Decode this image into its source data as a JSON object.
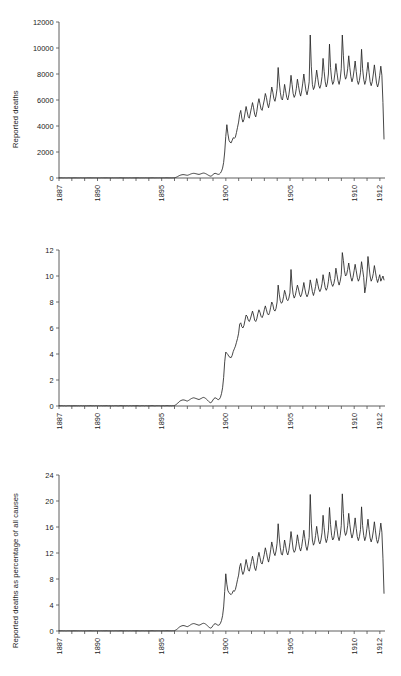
{
  "figure": {
    "title": "",
    "panel_count": 3,
    "background": "#ffffff",
    "line_color": "#262626",
    "axis_color": "#4d4d4d"
  },
  "chart_data": [
    {
      "type": "line",
      "panel_index": 0,
      "title": "",
      "xlabel": "",
      "ylabel": "Reported deaths",
      "xlim": [
        1887,
        1912.4
      ],
      "ylim": [
        0,
        12000
      ],
      "yticks": [
        0,
        2000,
        4000,
        6000,
        8000,
        10000,
        12000
      ],
      "ytick_labels": [
        "0",
        "2000",
        "4000",
        "6000",
        "8000",
        "10000",
        "12000"
      ],
      "xticks": [
        1887,
        1888,
        1889,
        1890,
        1891,
        1892,
        1893,
        1894,
        1895,
        1896,
        1897,
        1898,
        1899,
        1900,
        1901,
        1902,
        1903,
        1904,
        1905,
        1906,
        1907,
        1908,
        1909,
        1910,
        1911,
        1912
      ],
      "xtick_labels_shown": [
        "1887",
        "1890",
        "1895",
        "1900",
        "1905",
        "1910",
        "1912"
      ],
      "xtick_labels_shown_at": [
        1887,
        1890,
        1895,
        1900,
        1905,
        1910,
        1912
      ],
      "grid": false,
      "legend": "none",
      "x_step": 0.0833,
      "x_start": 1887.0,
      "values": [
        10,
        8,
        12,
        9,
        7,
        11,
        8,
        6,
        9,
        12,
        10,
        8,
        9,
        7,
        11,
        8,
        10,
        6,
        9,
        7,
        12,
        10,
        8,
        11,
        7,
        9,
        8,
        12,
        6,
        10,
        9,
        7,
        11,
        8,
        10,
        9,
        8,
        11,
        7,
        9,
        12,
        8,
        10,
        6,
        9,
        11,
        8,
        10,
        9,
        7,
        12,
        8,
        10,
        9,
        11,
        7,
        8,
        12,
        10,
        9,
        8,
        10,
        7,
        11,
        9,
        8,
        12,
        10,
        7,
        9,
        11,
        8,
        10,
        9,
        12,
        8,
        7,
        11,
        9,
        10,
        8,
        12,
        9,
        7,
        11,
        8,
        10,
        9,
        12,
        7,
        8,
        11,
        10,
        9,
        12,
        8,
        10,
        9,
        11,
        8,
        12,
        10,
        9,
        7,
        11,
        8,
        10,
        12,
        20,
        40,
        70,
        110,
        160,
        200,
        230,
        250,
        260,
        255,
        240,
        220,
        210,
        230,
        260,
        300,
        330,
        350,
        360,
        350,
        330,
        310,
        290,
        280,
        300,
        330,
        360,
        380,
        370,
        340,
        300,
        250,
        200,
        160,
        140,
        180,
        260,
        330,
        360,
        340,
        300,
        280,
        300,
        380,
        520,
        760,
        1200,
        2000,
        3200,
        4100,
        3400,
        2900,
        2750,
        2700,
        2900,
        3100,
        3050,
        3150,
        3500,
        3900,
        4300,
        4900,
        5200,
        4600,
        4300,
        4500,
        5000,
        5500,
        5100,
        4700,
        4600,
        5000,
        5400,
        5800,
        5400,
        4900,
        4700,
        5100,
        5700,
        6100,
        5700,
        5300,
        5200,
        5600,
        6000,
        6500,
        6200,
        5700,
        5400,
        5800,
        6400,
        7000,
        6600,
        6100,
        5900,
        6300,
        6900,
        8500,
        7400,
        6600,
        6100,
        6000,
        6500,
        7200,
        6700,
        6200,
        6000,
        6400,
        7000,
        7900,
        7200,
        6500,
        6200,
        6400,
        6900,
        7600,
        7100,
        6600,
        6300,
        6700,
        7300,
        8000,
        7300,
        6700,
        6400,
        6800,
        7400,
        11000,
        8600,
        7200,
        6800,
        7000,
        7600,
        8300,
        7700,
        7100,
        6900,
        7200,
        7800,
        9200,
        8200,
        7400,
        7000,
        7300,
        8000,
        10300,
        8500,
        7600,
        7200,
        7400,
        8000,
        8800,
        8100,
        7500,
        7200,
        7600,
        8400,
        11000,
        9400,
        8000,
        7600,
        7800,
        8400,
        9400,
        8500,
        7800,
        7400,
        7700,
        8300,
        9000,
        8200,
        7500,
        7200,
        7500,
        8100,
        9900,
        8400,
        7600,
        7200,
        7500,
        8200,
        8900,
        8100,
        7400,
        7100,
        7400,
        8000,
        8700,
        8000,
        7300,
        7000,
        7300,
        7900,
        8600,
        7900,
        5800,
        3000,
        500
      ]
    },
    {
      "type": "line",
      "panel_index": 1,
      "title": "",
      "xlabel": "",
      "ylabel": "Reported deaths as percentage of all causes",
      "xlim": [
        1887,
        1912.4
      ],
      "ylim": [
        0,
        12
      ],
      "yticks": [
        0,
        2,
        4,
        6,
        8,
        10,
        12
      ],
      "ytick_labels": [
        "0",
        "2",
        "4",
        "6",
        "8",
        "10",
        "12"
      ],
      "xticks": [
        1887,
        1888,
        1889,
        1890,
        1891,
        1892,
        1893,
        1894,
        1895,
        1896,
        1897,
        1898,
        1899,
        1900,
        1901,
        1902,
        1903,
        1904,
        1905,
        1906,
        1907,
        1908,
        1909,
        1910,
        1911,
        1912
      ],
      "xtick_labels_shown": [
        "1887",
        "1890",
        "1895",
        "1900",
        "1905",
        "1910",
        "1912"
      ],
      "xtick_labels_shown_at": [
        1887,
        1890,
        1895,
        1900,
        1905,
        1910,
        1912
      ],
      "grid": false,
      "legend": "none",
      "x_step": 0.0833,
      "x_start": 1887.0,
      "values": [
        0.02,
        0.01,
        0.02,
        0.02,
        0.01,
        0.02,
        0.01,
        0.01,
        0.02,
        0.02,
        0.02,
        0.01,
        0.02,
        0.01,
        0.02,
        0.01,
        0.02,
        0.01,
        0.02,
        0.01,
        0.02,
        0.02,
        0.01,
        0.02,
        0.01,
        0.02,
        0.01,
        0.02,
        0.01,
        0.02,
        0.02,
        0.01,
        0.02,
        0.01,
        0.02,
        0.02,
        0.01,
        0.02,
        0.01,
        0.02,
        0.02,
        0.01,
        0.02,
        0.01,
        0.02,
        0.02,
        0.01,
        0.02,
        0.02,
        0.01,
        0.02,
        0.01,
        0.02,
        0.02,
        0.02,
        0.01,
        0.01,
        0.02,
        0.02,
        0.02,
        0.01,
        0.02,
        0.01,
        0.02,
        0.02,
        0.01,
        0.02,
        0.02,
        0.01,
        0.02,
        0.02,
        0.01,
        0.02,
        0.02,
        0.02,
        0.01,
        0.01,
        0.02,
        0.02,
        0.02,
        0.01,
        0.02,
        0.02,
        0.01,
        0.02,
        0.01,
        0.02,
        0.02,
        0.02,
        0.01,
        0.01,
        0.02,
        0.02,
        0.02,
        0.02,
        0.01,
        0.02,
        0.02,
        0.02,
        0.01,
        0.02,
        0.02,
        0.02,
        0.01,
        0.02,
        0.01,
        0.02,
        0.02,
        0.04,
        0.08,
        0.14,
        0.21,
        0.3,
        0.37,
        0.42,
        0.45,
        0.47,
        0.46,
        0.44,
        0.4,
        0.38,
        0.42,
        0.47,
        0.53,
        0.58,
        0.61,
        0.63,
        0.61,
        0.58,
        0.55,
        0.52,
        0.5,
        0.54,
        0.58,
        0.63,
        0.66,
        0.64,
        0.59,
        0.52,
        0.44,
        0.35,
        0.28,
        0.25,
        0.32,
        0.46,
        0.58,
        0.63,
        0.6,
        0.53,
        0.49,
        0.53,
        0.67,
        0.95,
        1.4,
        2.2,
        3.4,
        4.15,
        4.05,
        3.95,
        3.8,
        3.75,
        3.72,
        3.9,
        4.2,
        4.4,
        4.6,
        4.9,
        5.2,
        5.6,
        6.3,
        6.4,
        6.1,
        6.0,
        6.2,
        6.6,
        7.0,
        6.9,
        6.6,
        6.5,
        6.7,
        7.0,
        7.3,
        7.0,
        6.6,
        6.5,
        6.7,
        7.1,
        7.4,
        7.2,
        6.9,
        6.8,
        7.0,
        7.4,
        7.7,
        7.4,
        7.1,
        7.0,
        7.2,
        7.6,
        8.0,
        7.8,
        7.4,
        7.3,
        7.5,
        8.0,
        9.3,
        8.6,
        8.1,
        7.9,
        8.0,
        8.4,
        8.9,
        8.6,
        8.2,
        8.1,
        8.3,
        8.7,
        10.5,
        9.3,
        8.6,
        8.3,
        8.5,
        8.9,
        9.3,
        9.0,
        8.6,
        8.4,
        8.6,
        9.0,
        9.5,
        9.0,
        8.6,
        8.4,
        8.6,
        9.0,
        9.7,
        9.3,
        8.8,
        8.5,
        8.8,
        9.2,
        9.8,
        9.4,
        9.0,
        8.8,
        9.0,
        9.4,
        10.1,
        9.6,
        9.1,
        8.9,
        9.1,
        9.6,
        10.3,
        9.8,
        9.4,
        9.2,
        9.4,
        9.8,
        10.6,
        10.1,
        9.6,
        9.3,
        9.6,
        10.1,
        11.8,
        11.2,
        10.4,
        10.0,
        10.1,
        10.5,
        11.0,
        10.4,
        9.9,
        9.6,
        9.9,
        10.4,
        10.9,
        10.4,
        9.9,
        9.6,
        9.8,
        10.3,
        11.1,
        10.5,
        9.9,
        8.7,
        9.2,
        10.0,
        11.5,
        10.7,
        10.0,
        9.6,
        9.8,
        10.2,
        10.8,
        10.3,
        9.8,
        9.5,
        9.8,
        10.1,
        9.6,
        9.8,
        10.0,
        9.7,
        10.1
      ]
    },
    {
      "type": "line",
      "panel_index": 2,
      "title": "",
      "xlabel": "",
      "ylabel": "Reported deaths per 100,000 population",
      "xlim": [
        1887,
        1912.4
      ],
      "ylim": [
        0,
        24
      ],
      "yticks": [
        0,
        4,
        8,
        12,
        16,
        20,
        24
      ],
      "ytick_labels": [
        "0",
        "4",
        "8",
        "12",
        "16",
        "20",
        "24"
      ],
      "xticks": [
        1887,
        1888,
        1889,
        1890,
        1891,
        1892,
        1893,
        1894,
        1895,
        1896,
        1897,
        1898,
        1899,
        1900,
        1901,
        1902,
        1903,
        1904,
        1905,
        1906,
        1907,
        1908,
        1909,
        1910,
        1911,
        1912
      ],
      "xtick_labels_shown": [
        "1887",
        "1890",
        "1895",
        "1900",
        "1905",
        "1910",
        "1912"
      ],
      "xtick_labels_shown_at": [
        1887,
        1890,
        1895,
        1900,
        1905,
        1910,
        1912
      ],
      "grid": false,
      "legend": "none",
      "x_step": 0.0833,
      "x_start": 1887.0,
      "values": [
        0.03,
        0.02,
        0.03,
        0.03,
        0.02,
        0.03,
        0.02,
        0.02,
        0.03,
        0.03,
        0.03,
        0.02,
        0.03,
        0.02,
        0.03,
        0.02,
        0.03,
        0.02,
        0.03,
        0.02,
        0.03,
        0.03,
        0.02,
        0.03,
        0.02,
        0.03,
        0.02,
        0.03,
        0.02,
        0.03,
        0.03,
        0.02,
        0.03,
        0.02,
        0.03,
        0.03,
        0.02,
        0.03,
        0.02,
        0.03,
        0.03,
        0.02,
        0.03,
        0.02,
        0.03,
        0.03,
        0.02,
        0.03,
        0.03,
        0.02,
        0.03,
        0.02,
        0.03,
        0.03,
        0.03,
        0.02,
        0.02,
        0.03,
        0.03,
        0.03,
        0.02,
        0.03,
        0.02,
        0.03,
        0.03,
        0.02,
        0.03,
        0.03,
        0.02,
        0.03,
        0.03,
        0.02,
        0.03,
        0.03,
        0.03,
        0.02,
        0.02,
        0.03,
        0.03,
        0.03,
        0.02,
        0.03,
        0.03,
        0.02,
        0.03,
        0.02,
        0.03,
        0.03,
        0.03,
        0.02,
        0.02,
        0.03,
        0.03,
        0.03,
        0.03,
        0.02,
        0.03,
        0.03,
        0.03,
        0.02,
        0.03,
        0.03,
        0.03,
        0.02,
        0.03,
        0.02,
        0.03,
        0.03,
        0.06,
        0.13,
        0.23,
        0.36,
        0.52,
        0.65,
        0.74,
        0.8,
        0.84,
        0.82,
        0.78,
        0.71,
        0.67,
        0.74,
        0.83,
        0.95,
        1.05,
        1.11,
        1.14,
        1.11,
        1.05,
        0.99,
        0.93,
        0.89,
        0.95,
        1.04,
        1.13,
        1.19,
        1.16,
        1.07,
        0.94,
        0.79,
        0.63,
        0.5,
        0.44,
        0.57,
        0.82,
        1.04,
        1.13,
        1.07,
        0.94,
        0.88,
        0.94,
        1.19,
        1.62,
        2.35,
        3.7,
        6.1,
        8.8,
        7.2,
        6.2,
        5.9,
        5.7,
        5.6,
        5.8,
        6.2,
        6.1,
        6.4,
        7.1,
        7.9,
        8.6,
        9.9,
        10.4,
        9.3,
        8.7,
        9.1,
        10.0,
        11.0,
        10.2,
        9.4,
        9.2,
        9.9,
        10.7,
        11.5,
        10.7,
        9.7,
        9.3,
        10.1,
        11.3,
        12.1,
        11.3,
        10.5,
        10.3,
        11.0,
        11.8,
        12.8,
        12.1,
        11.2,
        10.6,
        11.4,
        12.5,
        13.7,
        12.9,
        12.0,
        11.6,
        12.3,
        13.5,
        16.5,
        14.3,
        12.8,
        11.8,
        11.7,
        12.7,
        14.0,
        13.1,
        12.1,
        11.7,
        12.4,
        13.6,
        15.3,
        14.0,
        12.6,
        12.1,
        12.4,
        13.4,
        14.8,
        13.8,
        12.8,
        12.3,
        13.0,
        14.2,
        15.5,
        14.2,
        13.0,
        12.4,
        13.2,
        14.4,
        21.0,
        16.6,
        14.0,
        13.2,
        13.6,
        14.7,
        16.1,
        14.9,
        13.8,
        13.4,
        14.0,
        15.1,
        17.8,
        15.9,
        14.3,
        13.6,
        14.2,
        15.5,
        19.0,
        16.4,
        14.7,
        14.0,
        14.3,
        15.5,
        17.0,
        15.7,
        14.5,
        13.9,
        14.7,
        16.2,
        21.1,
        18.1,
        15.4,
        14.7,
        15.1,
        16.2,
        18.1,
        16.4,
        15.1,
        14.3,
        14.9,
        16.0,
        17.4,
        15.8,
        14.5,
        13.9,
        14.5,
        15.6,
        19.1,
        16.2,
        14.7,
        13.9,
        14.5,
        15.8,
        17.2,
        15.6,
        14.3,
        13.7,
        14.3,
        15.4,
        16.8,
        15.4,
        14.1,
        13.5,
        14.1,
        15.2,
        16.6,
        15.2,
        11.2,
        5.8,
        0.9
      ]
    }
  ]
}
